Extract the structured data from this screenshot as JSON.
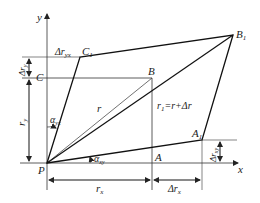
{
  "diagram": {
    "axes": {
      "x_label": "x",
      "y_label": "y"
    },
    "points": {
      "P": "P",
      "A": "A",
      "B": "B",
      "C": "C",
      "A1": "A",
      "A1_sub": "1",
      "B1": "B",
      "B1_sub": "1",
      "C1": "C",
      "C1_sub": "1"
    },
    "labels": {
      "r": "r",
      "r1_eq": "r",
      "r1_sub": "1",
      "r1_rest": "=r+Δr",
      "rx": "r",
      "rx_sub": "x",
      "ry": "r",
      "ry_sub": "y",
      "drx": "Δr",
      "drx_sub": "x",
      "dry": "Δr",
      "dry_sub": "y",
      "dryx": "Δr",
      "dryx_sub": "yx",
      "drxy": "Δr",
      "drxy_sub": "xy",
      "alpha_yx": "α",
      "alpha_yx_sub": "yx",
      "alpha_xy": "α",
      "alpha_xy_sub": "xy"
    }
  }
}
